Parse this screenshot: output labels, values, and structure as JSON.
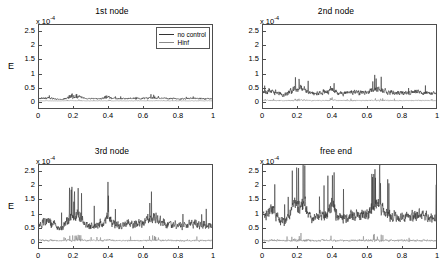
{
  "figure": {
    "exponent_label": "x 10",
    "exponent_sup": "-4",
    "ylabel": "E"
  },
  "legend": {
    "items": [
      {
        "label": "no control",
        "color": "#333333"
      },
      {
        "label": "Hinf",
        "color": "#8a8a8a"
      }
    ]
  },
  "axes": {
    "yticks": [
      "2.5",
      "2",
      "1.5",
      "1",
      "0.5",
      "0"
    ],
    "ytick_values": [
      2.5,
      2,
      1.5,
      1,
      0.5,
      0
    ],
    "xticks": [
      "0",
      "0.2",
      "0.4",
      "0.6",
      "0.8",
      "1"
    ],
    "xtick_values": [
      0,
      0.2,
      0.4,
      0.6,
      0.8,
      1
    ]
  },
  "chart_data": {
    "type": "line",
    "xlabel": "",
    "ylabel": "E",
    "y_multiplier": 0.0001,
    "xlim": [
      0,
      1
    ],
    "ylim": [
      -0.25,
      2.75
    ],
    "grid": false,
    "legend_position": "top-right of first panel",
    "panels": [
      {
        "title": "1st node",
        "has_legend": true,
        "series": [
          {
            "name": "no control",
            "color": "#333333",
            "baseline": 0.09,
            "noise": 0.05,
            "peak": 0.22
          },
          {
            "name": "Hinf",
            "color": "#8a8a8a",
            "baseline": 0.01,
            "noise": 0.012,
            "peak": 0.05
          }
        ]
      },
      {
        "title": "2nd node",
        "has_legend": false,
        "series": [
          {
            "name": "no control",
            "color": "#333333",
            "baseline": 0.3,
            "noise": 0.14,
            "peak": 0.85
          },
          {
            "name": "Hinf",
            "color": "#8a8a8a",
            "baseline": 0.02,
            "noise": 0.03,
            "peak": 0.12
          }
        ]
      },
      {
        "title": "3rd node",
        "has_legend": false,
        "series": [
          {
            "name": "no control",
            "color": "#333333",
            "baseline": 0.6,
            "noise": 0.26,
            "peak": 1.72
          },
          {
            "name": "Hinf",
            "color": "#8a8a8a",
            "baseline": 0.02,
            "noise": 0.05,
            "peak": 0.22
          }
        ]
      },
      {
        "title": "free end",
        "has_legend": false,
        "series": [
          {
            "name": "no control",
            "color": "#333333",
            "baseline": 0.9,
            "noise": 0.34,
            "peak": 2.65
          },
          {
            "name": "Hinf",
            "color": "#8a8a8a",
            "baseline": 0.02,
            "noise": 0.06,
            "peak": 0.3
          }
        ]
      }
    ]
  }
}
